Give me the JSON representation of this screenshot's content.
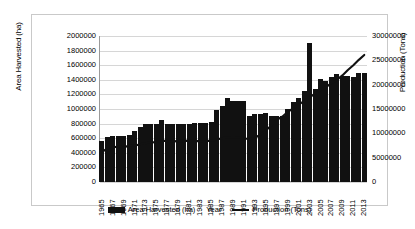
{
  "chart_data": {
    "type": "bar",
    "title": "",
    "xlabel": "Year",
    "grid": true,
    "legend_position": "bottom",
    "axes": {
      "left": {
        "label": "Area Harvested (ha)",
        "min": 0,
        "max": 2000000,
        "step": 200000,
        "ticks": [
          "0",
          "200000",
          "400000",
          "600000",
          "800000",
          "1000000",
          "1200000",
          "1400000",
          "1600000",
          "1800000",
          "2000000"
        ]
      },
      "right": {
        "label": "Production (Tons)",
        "min": 0,
        "max": 30000000,
        "step": 5000000,
        "ticks": [
          "0",
          "5000000",
          "10000000",
          "15000000",
          "20000000",
          "25000000",
          "30000000"
        ]
      }
    },
    "categories": [
      "1965",
      "1966",
      "1967",
      "1968",
      "1969",
      "1970",
      "1971",
      "1972",
      "1973",
      "1974",
      "1975",
      "1976",
      "1977",
      "1978",
      "1979",
      "1980",
      "1981",
      "1982",
      "1983",
      "1984",
      "1985",
      "1986",
      "1987",
      "1988",
      "1989",
      "1990",
      "1991",
      "1992",
      "1993",
      "1994",
      "1995",
      "1996",
      "1997",
      "1998",
      "1999",
      "2000",
      "2001",
      "2002",
      "2003",
      "2004",
      "2005",
      "2006",
      "2007",
      "2008",
      "2009",
      "2010",
      "2011",
      "2012",
      "2013"
    ],
    "tick_labels": [
      "1965",
      "1967",
      "1969",
      "1971",
      "1973",
      "1975",
      "1977",
      "1979",
      "1981",
      "1983",
      "1985",
      "1987",
      "1989",
      "1991",
      "1993",
      "1995",
      "1997",
      "1999",
      "2001",
      "2003",
      "2005",
      "2007",
      "2009",
      "2011",
      "2013"
    ],
    "series": [
      {
        "name": "Area Harvested (ha)",
        "type": "bar",
        "axis": "left",
        "color": "#111111",
        "values": [
          560000,
          620000,
          625000,
          630000,
          635000,
          640000,
          700000,
          760000,
          790000,
          800000,
          800000,
          855000,
          790000,
          795000,
          800000,
          800000,
          800000,
          805000,
          805000,
          810000,
          820000,
          985000,
          1035000,
          1150000,
          1105000,
          1110000,
          1110000,
          900000,
          930000,
          935000,
          940000,
          900000,
          905000,
          910000,
          1000000,
          1090000,
          1150000,
          1250000,
          1900000,
          1280000,
          1410000,
          1390000,
          1440000,
          1480000,
          1455000,
          1450000,
          1440000,
          1500000,
          1500000
        ]
      },
      {
        "name": "Production (Tons)",
        "type": "line",
        "axis": "right",
        "color": "#111111",
        "values": [
          6900000,
          6150000,
          7050000,
          7350000,
          7100000,
          7500000,
          7450000,
          7750000,
          7950000,
          8150000,
          8200000,
          8500000,
          8400000,
          8350000,
          8400000,
          8450000,
          8500000,
          8450000,
          8350000,
          8400000,
          8500000,
          8750000,
          9000000,
          9200000,
          9250000,
          9200000,
          9000000,
          8800000,
          9100000,
          9700000,
          10600000,
          11600000,
          12800000,
          13400000,
          14400000,
          15100000,
          15900000,
          16600000,
          17400000,
          18150000,
          18900000,
          19500000,
          20300000,
          21000000,
          21900000,
          23000000,
          24000000,
          25100000,
          26100000
        ]
      }
    ]
  },
  "legend": {
    "items": [
      {
        "label": "Area Harvested (ha)",
        "marker": "bar-swatch"
      },
      {
        "label": "Year",
        "marker": "none"
      },
      {
        "label": "Production (Tons)",
        "marker": "line-swatch"
      }
    ]
  }
}
